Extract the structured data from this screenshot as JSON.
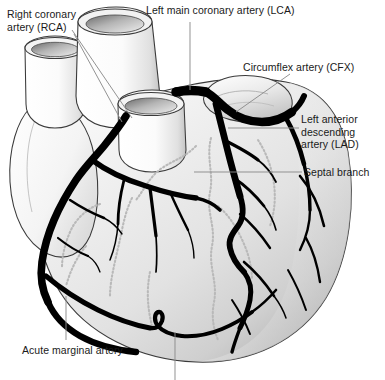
{
  "figure": {
    "organ": "heart",
    "view": "anterior",
    "background_color": "#ffffff"
  },
  "labels": [
    {
      "id": "rca",
      "text": "Right coronary\nartery (RCA)",
      "abbreviation": "RCA",
      "full_name": "Right coronary artery",
      "x": 7,
      "y": 8
    },
    {
      "id": "lca",
      "text": "Left main coronary artery (LCA)",
      "abbreviation": "LCA",
      "full_name": "Left main coronary artery",
      "x": 146,
      "y": 4
    },
    {
      "id": "cfx",
      "text": "Circumflex artery (CFX)",
      "abbreviation": "CFX",
      "full_name": "Circumflex artery",
      "x": 243,
      "y": 61
    },
    {
      "id": "lad",
      "text": "Left anterior\ndescending\nartery (LAD)",
      "abbreviation": "LAD",
      "full_name": "Left anterior descending artery",
      "x": 301,
      "y": 113
    },
    {
      "id": "septal",
      "text": "Septal branch",
      "abbreviation": "",
      "full_name": "Septal branch",
      "x": 304,
      "y": 166
    },
    {
      "id": "acute-marginal",
      "text": "Acute marginal artery",
      "abbreviation": "",
      "full_name": "Acute marginal artery",
      "x": 22,
      "y": 344
    }
  ],
  "colors": {
    "artery_dark": "#000000",
    "leader_line": "#8c8c8c",
    "outline": "#3a3a3a",
    "myocardium_light": "#f2f2f2",
    "myocardium_mid": "#dcdcdc",
    "myocardium_shadow": "#b2b2b2",
    "vessel_stump_light": "#fbfbfb",
    "vessel_stump_shadow": "#9a9a9a",
    "septal_dashed": "#b9b9b9",
    "text": "#1a1a1a"
  },
  "structures": [
    {
      "name": "aorta-stump",
      "kind": "great-vessel"
    },
    {
      "name": "pulmonary-trunk-stump",
      "kind": "great-vessel"
    },
    {
      "name": "superior-vena-cava-stump",
      "kind": "great-vessel"
    },
    {
      "name": "right-atrial-appendage",
      "kind": "chamber"
    },
    {
      "name": "left-atrial-appendage",
      "kind": "chamber"
    },
    {
      "name": "right-ventricle",
      "kind": "chamber"
    },
    {
      "name": "left-ventricle",
      "kind": "chamber"
    },
    {
      "name": "right-coronary-artery",
      "kind": "artery"
    },
    {
      "name": "left-main-coronary-artery",
      "kind": "artery"
    },
    {
      "name": "circumflex-artery",
      "kind": "artery"
    },
    {
      "name": "left-anterior-descending-artery",
      "kind": "artery"
    },
    {
      "name": "septal-branch",
      "kind": "artery-hidden"
    },
    {
      "name": "acute-marginal-artery",
      "kind": "artery"
    },
    {
      "name": "diagonal-branches",
      "kind": "artery"
    }
  ]
}
